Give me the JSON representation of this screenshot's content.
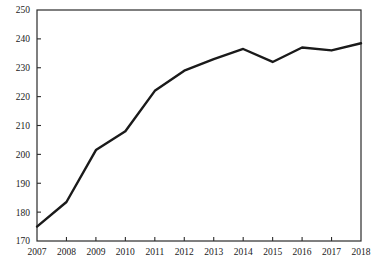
{
  "chart_data": {
    "type": "line",
    "title": "",
    "subtitle": "",
    "xlabel": "",
    "ylabel": "",
    "categories": [
      "2007",
      "2008",
      "2009",
      "2010",
      "2011",
      "2012",
      "2013",
      "2014",
      "2015",
      "2016",
      "2017",
      "2018"
    ],
    "x": [
      2007,
      2008,
      2009,
      2010,
      2011,
      2012,
      2013,
      2014,
      2015,
      2016,
      2017,
      2018
    ],
    "values": [
      175,
      183.5,
      201.5,
      208,
      222,
      229,
      233,
      236.5,
      232,
      237,
      236,
      238.5
    ],
    "series": [
      {
        "name": "",
        "values": [
          175,
          183.5,
          201.5,
          208,
          222,
          229,
          233,
          236.5,
          232,
          237,
          236,
          238.5
        ]
      }
    ],
    "xlim": [
      2007,
      2018
    ],
    "ylim": [
      170,
      250
    ],
    "y_ticks": [
      170,
      180,
      190,
      200,
      210,
      220,
      230,
      240,
      250
    ],
    "y_tick_labels": [
      "170",
      "180",
      "190",
      "200",
      "210",
      "220",
      "230",
      "240",
      "250"
    ],
    "x_ticks": [
      2007,
      2008,
      2009,
      2010,
      2011,
      2012,
      2013,
      2014,
      2015,
      2016,
      2017,
      2018
    ],
    "x_tick_labels": [
      "2007",
      "2008",
      "2009",
      "2010",
      "2011",
      "2012",
      "2013",
      "2014",
      "2015",
      "2016",
      "2017",
      "2018"
    ],
    "grid": false,
    "legend": false,
    "legend_position": "none",
    "annotations": [],
    "line_color": "#1a1a1a",
    "line_width": 2.4,
    "axis_color": "#2b2b2b",
    "background_color": "#ffffff"
  },
  "plot": {
    "left": 37,
    "right": 361,
    "top": 10,
    "bottom": 241
  }
}
